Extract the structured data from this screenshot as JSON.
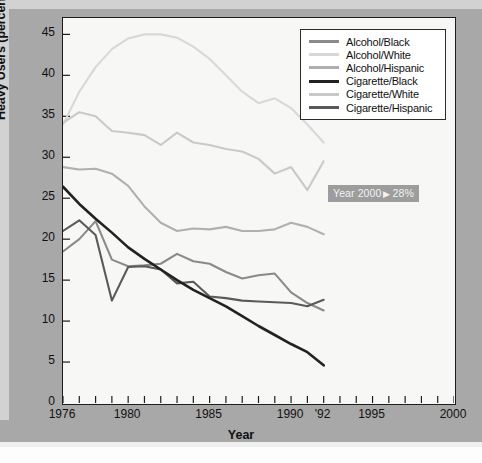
{
  "figure": {
    "x_axis_title": "Year",
    "y_axis_title": "Heavy Users (percent)"
  },
  "annotation": {
    "prefix": "Year 2000",
    "arrow": "▶",
    "value": "28%",
    "full_text": "Year 2000 ▶ 28%",
    "color": "#9d9d9d"
  },
  "legend": {
    "items": [
      {
        "label": "Alcohol/Black",
        "color": "#8a8a8a"
      },
      {
        "label": "Alcohol/White",
        "color": "#d8d8d8"
      },
      {
        "label": "Alcohol/Hispanic",
        "color": "#b0b0b0"
      },
      {
        "label": "Cigarette/Black",
        "color": "#222222"
      },
      {
        "label": "Cigarette/White",
        "color": "#c9c9c9"
      },
      {
        "label": "Cigarette/Hispanic",
        "color": "#5a5a5a"
      }
    ]
  },
  "chart_data": {
    "type": "line",
    "title": "",
    "xlabel": "Year",
    "ylabel": "Heavy Users (percent)",
    "xlim": [
      1976,
      2000
    ],
    "ylim": [
      0,
      47
    ],
    "grid": false,
    "legend_position": "top-right",
    "y_ticks": [
      0,
      5,
      10,
      15,
      20,
      25,
      30,
      35,
      40,
      45
    ],
    "x_ticks": [
      1976,
      1977,
      1978,
      1979,
      1980,
      1981,
      1982,
      1983,
      1984,
      1985,
      1986,
      1987,
      1988,
      1989,
      1990,
      1991,
      1992,
      1993,
      1994,
      1995,
      1996,
      1997,
      1998,
      1999,
      2000
    ],
    "x_tick_labels": [
      {
        "value": 1976,
        "label": "1976"
      },
      {
        "value": 1980,
        "label": "1980"
      },
      {
        "value": 1985,
        "label": "1985"
      },
      {
        "value": 1990,
        "label": "1990"
      },
      {
        "value": 1992,
        "label": "'92"
      },
      {
        "value": 1995,
        "label": "1995"
      },
      {
        "value": 2000,
        "label": "2000"
      }
    ],
    "x": [
      1976,
      1977,
      1978,
      1979,
      1980,
      1981,
      1982,
      1983,
      1984,
      1985,
      1986,
      1987,
      1988,
      1989,
      1990,
      1991,
      1992
    ],
    "series": [
      {
        "name": "Alcohol/Black",
        "color": "#8a8a8a",
        "values": [
          18.5,
          20.0,
          22.2,
          17.5,
          16.7,
          16.8,
          17.0,
          18.2,
          17.3,
          17.0,
          16.0,
          15.2,
          15.6,
          15.8,
          13.5,
          12.2,
          11.3
        ]
      },
      {
        "name": "Alcohol/White",
        "color": "#d8d8d8",
        "values": [
          34.0,
          38.0,
          41.0,
          43.2,
          44.5,
          45.0,
          45.0,
          44.6,
          43.5,
          42.0,
          40.0,
          38.0,
          36.6,
          37.2,
          36.0,
          34.0,
          31.8
        ]
      },
      {
        "name": "Alcohol/Hispanic",
        "color": "#b0b0b0",
        "values": [
          28.8,
          28.5,
          28.6,
          28.0,
          26.5,
          24.0,
          22.0,
          21.0,
          21.3,
          21.2,
          21.5,
          21.0,
          21.0,
          21.2,
          22.0,
          21.5,
          20.6
        ]
      },
      {
        "name": "Cigarette/Black",
        "color": "#222222",
        "values": [
          26.4,
          24.3,
          22.5,
          20.8,
          19.0,
          17.6,
          16.3,
          15.0,
          13.8,
          12.8,
          11.8,
          10.6,
          9.4,
          8.3,
          7.2,
          6.2,
          4.6
        ]
      },
      {
        "name": "Cigarette/White",
        "color": "#c9c9c9",
        "values": [
          34.2,
          35.5,
          35.0,
          33.2,
          33.0,
          32.7,
          31.5,
          33.0,
          31.8,
          31.5,
          31.0,
          30.7,
          29.8,
          28.0,
          28.8,
          26.0,
          29.5
        ]
      },
      {
        "name": "Cigarette/Hispanic",
        "color": "#5a5a5a",
        "values": [
          21.0,
          22.3,
          20.5,
          12.5,
          16.6,
          16.7,
          16.3,
          14.6,
          14.8,
          13.0,
          12.8,
          12.5,
          12.4,
          12.3,
          12.2,
          11.8,
          12.6
        ]
      }
    ]
  }
}
